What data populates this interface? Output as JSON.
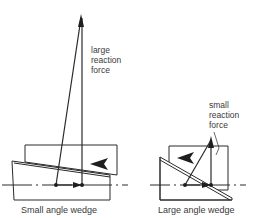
{
  "diagram": {
    "left": {
      "annotation": [
        "large",
        "reaction",
        "force"
      ],
      "caption": "Small angle wedge"
    },
    "right": {
      "annotation": [
        "small",
        "reaction",
        "force"
      ],
      "caption": "Large angle wedge"
    },
    "colors": {
      "line": "#2a2a2a",
      "background": "#ffffff"
    }
  }
}
